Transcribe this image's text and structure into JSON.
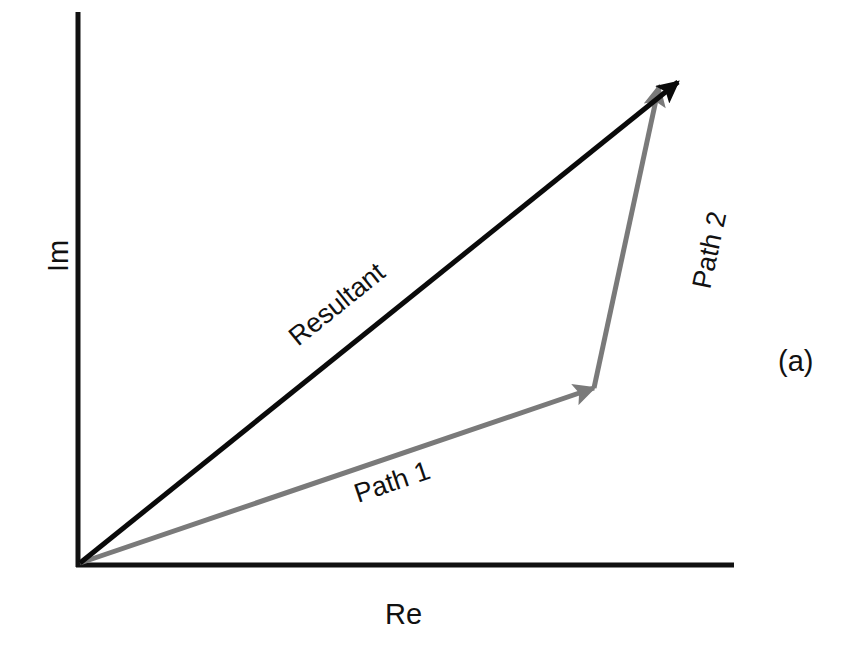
{
  "figure": {
    "panel_label": "(a)",
    "axes": {
      "x_label": "Re",
      "y_label": "Im",
      "color": "#111111"
    },
    "vectors": [
      {
        "id": "resultant",
        "label": "Resultant",
        "color": "#0a0a0a"
      },
      {
        "id": "path1",
        "label": "Path 1",
        "color": "#7a7a7a"
      },
      {
        "id": "path2",
        "label": "Path 2",
        "color": "#7a7a7a"
      }
    ]
  }
}
